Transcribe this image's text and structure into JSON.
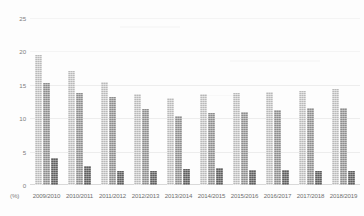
{
  "chart_data": {
    "type": "bar",
    "title": "",
    "xlabel": "",
    "ylabel": "",
    "unit_label": "(%)",
    "ylim": [
      0,
      25
    ],
    "yticks": [
      0,
      5,
      10,
      15,
      20,
      25
    ],
    "ytick_labels": [
      "0",
      "5",
      "10",
      "15",
      "20",
      "25"
    ],
    "grid": true,
    "legend": "none",
    "categories": [
      "2009/2010",
      "2010/2011",
      "2011/2012",
      "2012/2013",
      "2013/2014",
      "2014/2015",
      "2015/2016",
      "2016/2017",
      "2017/2018",
      "2018/2019"
    ],
    "series": [
      {
        "name": "series-1",
        "color": "#b9b9b9",
        "values": [
          19.5,
          17.0,
          15.4,
          13.6,
          13.1,
          13.6,
          13.7,
          13.9,
          14.1,
          14.3
        ]
      },
      {
        "name": "series-2",
        "color": "#8d8d8d",
        "values": [
          15.2,
          13.7,
          13.2,
          11.4,
          10.4,
          10.8,
          11.0,
          11.2,
          11.5,
          11.6
        ]
      },
      {
        "name": "series-3",
        "color": "#5e5e5e",
        "values": [
          4.0,
          2.8,
          2.1,
          2.1,
          2.4,
          2.6,
          2.2,
          2.2,
          2.1,
          2.1
        ]
      }
    ]
  }
}
